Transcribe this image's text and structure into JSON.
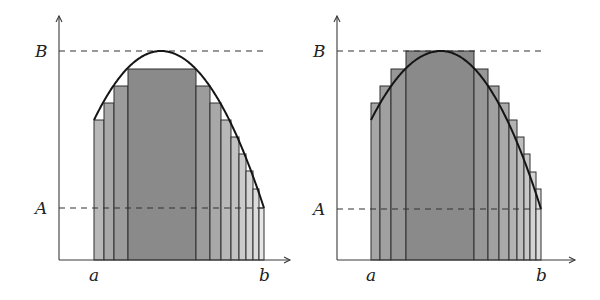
{
  "figure": {
    "panels": [
      {
        "id": "lower-sum",
        "labels": {
          "y_top": "B",
          "y_bottom": "A",
          "x_left": "a",
          "x_right": "b"
        },
        "axis": {
          "x0": 59,
          "y0": 260,
          "top": 16,
          "right": 290
        },
        "B_y": 51,
        "A_y": 208,
        "baseline": 260,
        "curve": {
          "x_start": 94,
          "y_start": 120,
          "peak_x": 161,
          "peak_y": 51,
          "x_end": 264,
          "y_end": 208
        },
        "dash_end": 268,
        "bars": [
          {
            "x0": 94,
            "x1": 104,
            "top": 120,
            "fill": "#b8b8b8"
          },
          {
            "x0": 104,
            "x1": 114,
            "top": 103,
            "fill": "#a8a8a8"
          },
          {
            "x0": 114,
            "x1": 128,
            "top": 86,
            "fill": "#9c9c9c"
          },
          {
            "x0": 128,
            "x1": 196,
            "top": 69,
            "fill": "#8a8a8a"
          },
          {
            "x0": 196,
            "x1": 210,
            "top": 86,
            "fill": "#9c9c9c"
          },
          {
            "x0": 210,
            "x1": 221,
            "top": 103,
            "fill": "#a8a8a8"
          },
          {
            "x0": 221,
            "x1": 231,
            "top": 120,
            "fill": "#b8b8b8"
          },
          {
            "x0": 231,
            "x1": 239,
            "top": 137,
            "fill": "#c2c2c2"
          },
          {
            "x0": 239,
            "x1": 246,
            "top": 154,
            "fill": "#cbcbcb"
          },
          {
            "x0": 246,
            "x1": 253,
            "top": 171,
            "fill": "#d4d4d4"
          },
          {
            "x0": 253,
            "x1": 259,
            "top": 189,
            "fill": "#dcdcdc"
          },
          {
            "x0": 259,
            "x1": 264,
            "top": 208,
            "fill": "#e6e6e6"
          }
        ]
      },
      {
        "id": "upper-sum",
        "labels": {
          "y_top": "B",
          "y_bottom": "A",
          "x_left": "a",
          "x_right": "b"
        },
        "axis": {
          "x0": 337,
          "y0": 260,
          "top": 16,
          "right": 575
        },
        "B_y": 51,
        "A_y": 209,
        "baseline": 260,
        "curve": {
          "x_start": 371,
          "y_start": 120,
          "peak_x": 441,
          "peak_y": 51,
          "x_end": 541,
          "y_end": 209
        },
        "dash_end": 545,
        "bars": [
          {
            "x0": 371,
            "x1": 380,
            "top": 103,
            "fill": "#a6a6a6"
          },
          {
            "x0": 380,
            "x1": 391,
            "top": 86,
            "fill": "#a0a0a0"
          },
          {
            "x0": 391,
            "x1": 406,
            "top": 69,
            "fill": "#979797"
          },
          {
            "x0": 406,
            "x1": 474,
            "top": 51,
            "fill": "#8a8a8a"
          },
          {
            "x0": 474,
            "x1": 488,
            "top": 69,
            "fill": "#979797"
          },
          {
            "x0": 488,
            "x1": 499,
            "top": 86,
            "fill": "#a0a0a0"
          },
          {
            "x0": 499,
            "x1": 509,
            "top": 103,
            "fill": "#a9a9a9"
          },
          {
            "x0": 509,
            "x1": 517,
            "top": 120,
            "fill": "#b3b3b3"
          },
          {
            "x0": 517,
            "x1": 524,
            "top": 137,
            "fill": "#bebebe"
          },
          {
            "x0": 524,
            "x1": 530,
            "top": 154,
            "fill": "#c8c8c8"
          },
          {
            "x0": 530,
            "x1": 536,
            "top": 172,
            "fill": "#d3d3d3"
          },
          {
            "x0": 536,
            "x1": 541,
            "top": 189,
            "fill": "#dedede"
          }
        ]
      }
    ]
  }
}
